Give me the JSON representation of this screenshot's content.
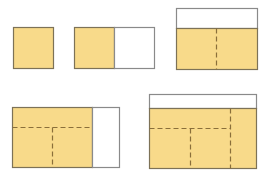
{
  "colors": {
    "fill": "#f8da8a",
    "empty": "#ffffff",
    "border": "#7d7257",
    "white_border": "#8a8a8a",
    "dash": "#8a6f3a"
  },
  "figures": [
    {
      "name": "figure-1-single-square",
      "rects": [
        {
          "kind": "filled",
          "x": 13,
          "y": 27,
          "w": 40,
          "h": 41
        }
      ],
      "dashes": []
    },
    {
      "name": "figure-2-square-plus-white",
      "rects": [
        {
          "kind": "filled",
          "x": 74,
          "y": 27,
          "w": 40,
          "h": 41
        },
        {
          "kind": "empty",
          "x": 114,
          "y": 27,
          "w": 40,
          "h": 41
        }
      ],
      "dashes": []
    },
    {
      "name": "figure-3-two-squares-with-top-strip",
      "rects": [
        {
          "kind": "empty",
          "x": 176,
          "y": 8,
          "w": 81,
          "h": 20
        },
        {
          "kind": "filled",
          "x": 176,
          "y": 28,
          "w": 81,
          "h": 41
        }
      ],
      "dashes": [
        {
          "x1": 216,
          "y1": 28,
          "x2": 216,
          "y2": 69
        }
      ]
    },
    {
      "name": "figure-4-grid-with-right-strip",
      "rects": [
        {
          "kind": "filled",
          "x": 12,
          "y": 107,
          "w": 80,
          "h": 60
        },
        {
          "kind": "empty",
          "x": 92,
          "y": 107,
          "w": 27,
          "h": 60
        }
      ],
      "dashes": [
        {
          "x1": 12,
          "y1": 127,
          "x2": 92,
          "y2": 127
        },
        {
          "x1": 52,
          "y1": 127,
          "x2": 52,
          "y2": 167
        }
      ]
    },
    {
      "name": "figure-5-grid-with-top-strip",
      "rects": [
        {
          "kind": "empty",
          "x": 149,
          "y": 94,
          "w": 107,
          "h": 14
        },
        {
          "kind": "filled",
          "x": 149,
          "y": 108,
          "w": 107,
          "h": 60
        }
      ],
      "dashes": [
        {
          "x1": 230,
          "y1": 108,
          "x2": 230,
          "y2": 168
        },
        {
          "x1": 149,
          "y1": 128,
          "x2": 230,
          "y2": 128
        },
        {
          "x1": 190,
          "y1": 128,
          "x2": 190,
          "y2": 168
        }
      ]
    }
  ]
}
